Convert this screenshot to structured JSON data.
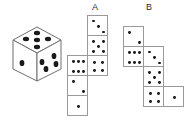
{
  "figure": {
    "title": "",
    "background_color": "#ffffff",
    "pip_color": "#1a1a1a",
    "outline_color": "#9a9a9a",
    "die_outline_color": "#6e6e6e"
  },
  "labels": {
    "net_a": "A",
    "net_b": "B"
  },
  "die_3d": {
    "name": "isometric-die",
    "faces": [
      {
        "position": "top",
        "pips": 5,
        "pattern": "five"
      },
      {
        "position": "front-left",
        "pips": 1,
        "pattern": "one"
      },
      {
        "position": "front-right",
        "pips": 4,
        "pattern": "four"
      }
    ]
  },
  "nets": [
    {
      "label": "A",
      "cells": [
        {
          "id": "a1",
          "col": 1,
          "row": 0,
          "pips": 3,
          "pattern": "three"
        },
        {
          "id": "a2",
          "col": 1,
          "row": 1,
          "pips": 5,
          "pattern": "five"
        },
        {
          "id": "a3",
          "col": 0,
          "row": 2,
          "pips": 6,
          "pattern": "six"
        },
        {
          "id": "a4",
          "col": 1,
          "row": 2,
          "pips": 4,
          "pattern": "four"
        },
        {
          "id": "a5",
          "col": 0,
          "row": 3,
          "pips": 2,
          "pattern": "two"
        },
        {
          "id": "a6",
          "col": 0,
          "row": 4,
          "pips": 1,
          "pattern": "one"
        }
      ]
    },
    {
      "label": "B",
      "cells": [
        {
          "id": "b1",
          "col": 0,
          "row": 0,
          "pips": 2,
          "pattern": "two"
        },
        {
          "id": "b2",
          "col": 0,
          "row": 1,
          "pips": 6,
          "pattern": "six"
        },
        {
          "id": "b3",
          "col": 1,
          "row": 1,
          "pips": 3,
          "pattern": "three"
        },
        {
          "id": "b4",
          "col": 1,
          "row": 2,
          "pips": 5,
          "pattern": "five"
        },
        {
          "id": "b5",
          "col": 1,
          "row": 3,
          "pips": 4,
          "pattern": "four"
        },
        {
          "id": "b6",
          "col": 2,
          "row": 3,
          "pips": 1,
          "pattern": "one"
        }
      ]
    }
  ]
}
